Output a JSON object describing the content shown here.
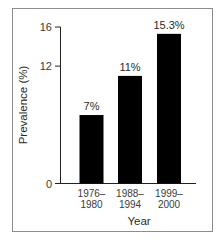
{
  "chart_data": {
    "type": "bar",
    "title": "",
    "xlabel": "Year",
    "ylabel": "Prevalence (%)",
    "categories": [
      "1976–1980",
      "1988–1994",
      "1999–2000"
    ],
    "category_lines": [
      [
        "1976–",
        "1980"
      ],
      [
        "1988–",
        "1994"
      ],
      [
        "1999–",
        "2000"
      ]
    ],
    "values": [
      7,
      11,
      15.3
    ],
    "data_labels": [
      "7%",
      "11%",
      "15.3%"
    ],
    "ylim": [
      0,
      16
    ],
    "yticks": [
      0,
      12,
      16
    ],
    "ytick_labels": [
      "0",
      "12",
      "16"
    ],
    "grid": false,
    "legend": null,
    "bar_color": "#000000"
  }
}
